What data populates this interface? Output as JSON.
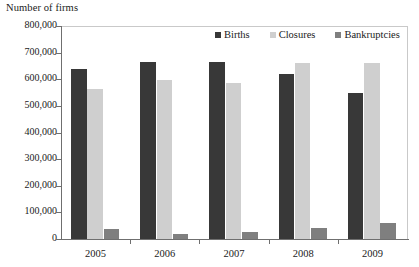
{
  "chart_data": {
    "type": "bar",
    "title": "",
    "ylabel": "Number of firms",
    "xlabel": "",
    "categories": [
      "2005",
      "2006",
      "2007",
      "2008",
      "2009"
    ],
    "series": [
      {
        "name": "Births",
        "color": "#383838",
        "values": [
          640000,
          665000,
          665000,
          620000,
          550000
        ]
      },
      {
        "name": "Closures",
        "color": "#cfcfcf",
        "values": [
          562000,
          597000,
          587000,
          660000,
          660000
        ]
      },
      {
        "name": "Bankruptcies",
        "color": "#7f7f7f",
        "values": [
          39000,
          20000,
          28000,
          43000,
          60000
        ]
      }
    ],
    "ylim": [
      0,
      800000
    ],
    "ytick_values": [
      800000,
      700000,
      600000,
      500000,
      400000,
      300000,
      200000,
      100000,
      0
    ],
    "ytick_labels": [
      "800,000",
      "700,000",
      "600,000",
      "500,000",
      "400,000",
      "300,000",
      "200,000",
      "100,000",
      "0"
    ],
    "grid": false,
    "legend_position": "top-right"
  }
}
